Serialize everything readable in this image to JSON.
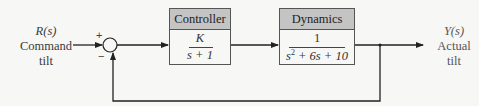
{
  "input": {
    "symbol": "R(s)",
    "label_line1": "Command",
    "label_line2": "tilt"
  },
  "output": {
    "symbol": "Y(s)",
    "label_line1": "Actual",
    "label_line2": "tilt"
  },
  "summing_junction": {
    "plus_sign": "+",
    "minus_sign": "−"
  },
  "controller": {
    "title": "Controller",
    "numerator": "K",
    "denominator": "s + 1"
  },
  "dynamics": {
    "title": "Dynamics",
    "numerator": "1",
    "denominator_s": "s",
    "denominator_exp": "2",
    "denominator_rest": " + 6s + 10"
  },
  "colors": {
    "header_fill": "#c4c4c4",
    "line": "#222222",
    "background": "#f7f7f5"
  }
}
